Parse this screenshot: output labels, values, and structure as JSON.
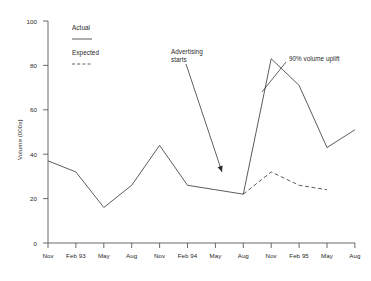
{
  "chart_data": {
    "type": "line",
    "title": "",
    "xlabel": "",
    "ylabel": "Volume (000s)",
    "ylim": [
      0,
      100
    ],
    "yticks": [
      0,
      20,
      40,
      60,
      80,
      100
    ],
    "grid": false,
    "legend_position": "top-left-inside",
    "categories": [
      "Nov",
      "Feb 93",
      "May",
      "Aug",
      "Nov",
      "Feb 94",
      "May",
      "Aug",
      "Nov",
      "Feb 95",
      "May",
      "Aug"
    ],
    "series": [
      {
        "name": "Actual",
        "style": "solid",
        "values": [
          37,
          32,
          16,
          26,
          44,
          26,
          24,
          22,
          83,
          71,
          43,
          51
        ]
      },
      {
        "name": "Expected",
        "style": "dashed",
        "values": [
          null,
          null,
          null,
          null,
          null,
          null,
          null,
          22,
          32,
          26,
          24,
          null
        ]
      }
    ],
    "annotations": [
      {
        "id": "advertising-starts",
        "text": "Advertising\nstarts",
        "text_x": 171,
        "text_y": 48,
        "arrow_from_x": 186,
        "arrow_from_y": 64,
        "arrow_to_x": 222,
        "arrow_to_y": 172
      },
      {
        "id": "volume-uplift",
        "text": "90% volume uplift",
        "text_x": 289,
        "text_y": 55,
        "arrow_from_x": 286,
        "arrow_from_y": 62,
        "arrow_to_x": 262,
        "arrow_to_y": 92
      }
    ]
  },
  "legend": {
    "entries": [
      {
        "label": "Actual",
        "style": "solid"
      },
      {
        "label": "Expected",
        "style": "dashed"
      }
    ]
  },
  "axis": {
    "y_title": "Volume (000s)",
    "y_labels": [
      "100",
      "80",
      "60",
      "40",
      "20",
      "0"
    ],
    "x_labels": [
      "Nov",
      "Feb 93",
      "May",
      "Aug",
      "Nov",
      "Feb 94",
      "May",
      "Aug",
      "Nov",
      "Feb 95",
      "May",
      "Aug"
    ]
  }
}
